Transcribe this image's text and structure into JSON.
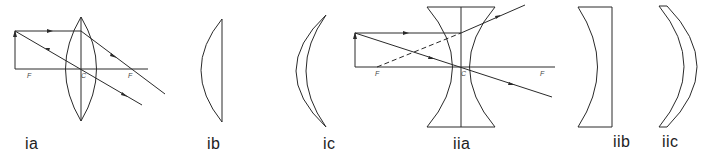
{
  "figure": {
    "panels": [
      {
        "id": "ia",
        "label": "ia",
        "description": "converging (biconvex) lens ray diagram"
      },
      {
        "id": "ib",
        "label": "ib",
        "description": "plano-convex lens"
      },
      {
        "id": "ic",
        "label": "ic",
        "description": "converging meniscus lens"
      },
      {
        "id": "iia",
        "label": "iia",
        "description": "diverging (biconcave) lens ray diagram"
      },
      {
        "id": "iib",
        "label": "iib",
        "description": "plano-concave lens"
      },
      {
        "id": "iic",
        "label": "iic",
        "description": "diverging meniscus lens"
      }
    ],
    "ia_marks": {
      "f_left": "F",
      "center": "C",
      "f_right": "F"
    },
    "iia_marks": {
      "f_left": "F",
      "center": "C",
      "f_right": "F"
    },
    "colors": {
      "stroke": "#2a2a2a",
      "background": "#ffffff"
    }
  }
}
